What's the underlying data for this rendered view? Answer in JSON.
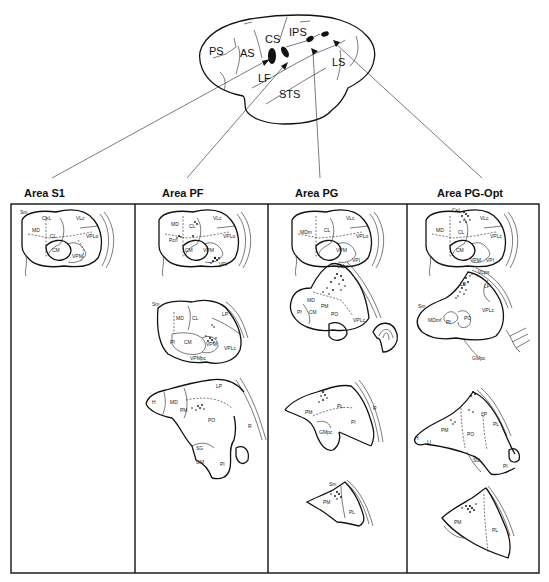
{
  "brain": {
    "sulci_labels": [
      {
        "id": "PS",
        "text": "PS",
        "x": 209,
        "y": 55
      },
      {
        "id": "AS",
        "text": "AS",
        "x": 240,
        "y": 57
      },
      {
        "id": "CS",
        "text": "CS",
        "x": 266,
        "y": 43
      },
      {
        "id": "IPS",
        "text": "IPS",
        "x": 291,
        "y": 38
      },
      {
        "id": "LF",
        "text": "LF",
        "x": 259,
        "y": 81
      },
      {
        "id": "STS",
        "text": "STS",
        "x": 280,
        "y": 99
      },
      {
        "id": "LS",
        "text": "LS",
        "x": 333,
        "y": 66
      }
    ]
  },
  "columns": [
    {
      "id": "s1",
      "title": "Area S1",
      "sections": [
        {
          "nuclei": [
            "Sm",
            "CeL",
            "MD",
            "CL",
            "VLc",
            "VPLo",
            "CM",
            "VPM"
          ]
        }
      ]
    },
    {
      "id": "pf",
      "title": "Area PF",
      "sections": [
        {
          "nuclei": [
            "MD",
            "CL",
            "VLc",
            "Pcn",
            "CM",
            "VPM",
            "VPLo",
            "VPI"
          ]
        },
        {
          "nuclei": [
            "Sm",
            "MD",
            "CL",
            "LP",
            "Pf",
            "CM",
            "VPM",
            "VPMpc",
            "VPLc"
          ]
        },
        {
          "nuclei": [
            "H",
            "MD",
            "LP",
            "PM",
            "PO",
            "SG",
            "GM",
            "PI",
            "R"
          ]
        }
      ]
    },
    {
      "id": "pg",
      "title": "Area PG",
      "sections": [
        {
          "nuclei": [
            "MDm",
            "CL",
            "VLc",
            "VPM",
            "VPLo",
            "VPI"
          ]
        },
        {
          "nuclei": [
            "VLps",
            "MD",
            "PM",
            "Pf",
            "CM",
            "PO",
            "VPLc"
          ]
        },
        {
          "nuclei": [
            "PM",
            "PL",
            "GMpc",
            "PI",
            "R"
          ]
        },
        {
          "nuclei": [
            "Sm",
            "PM",
            "PL"
          ]
        }
      ]
    },
    {
      "id": "pgopt",
      "title": "Area PG-Opt",
      "sections": [
        {
          "nuclei": [
            "CeL",
            "MD",
            "CL",
            "CM",
            "VLc",
            "VPLc",
            "VPM",
            "VPI"
          ]
        },
        {
          "nuclei": [
            "VLps",
            "LD",
            "LP",
            "Sm",
            "MDmf",
            "Pf",
            "PO",
            "VPLc",
            "GMpc"
          ]
        },
        {
          "nuclei": [
            "H",
            "LI",
            "PM",
            "PO",
            "LP",
            "PL",
            "SG",
            "PI"
          ]
        },
        {
          "nuclei": [
            "PM",
            "PL"
          ]
        }
      ]
    }
  ]
}
